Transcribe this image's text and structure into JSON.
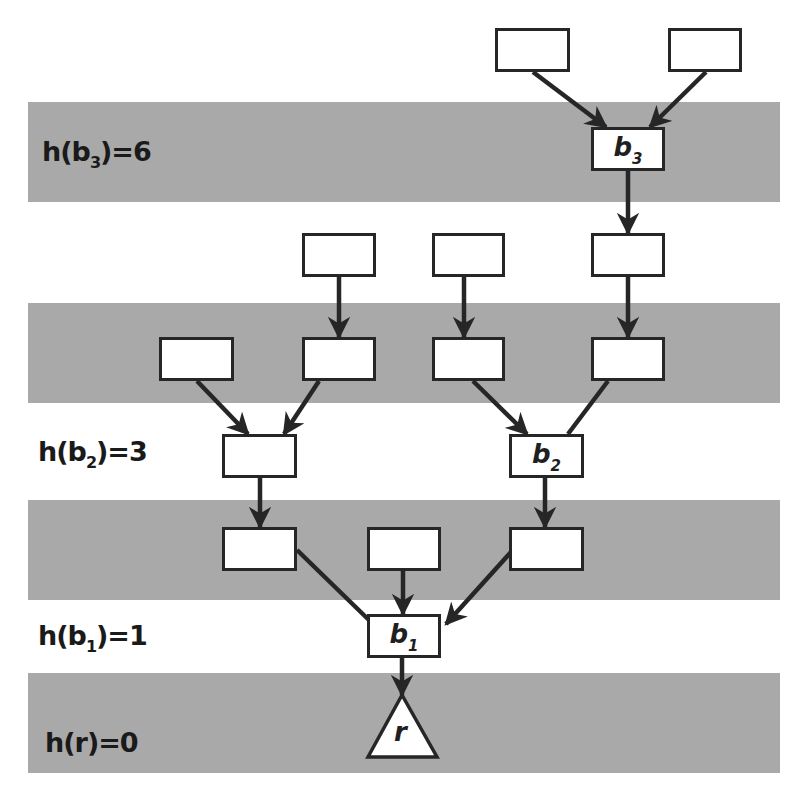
{
  "diagram": {
    "colors": {
      "band": "#a9a9a9",
      "background": "#ffffff",
      "stroke": "#262626",
      "node_fill": "#ffffff"
    },
    "bands": [
      {
        "id": "band-b3",
        "top": 102,
        "height": 100
      },
      {
        "id": "band-mid",
        "top": 303,
        "height": 100
      },
      {
        "id": "band-lower",
        "top": 500,
        "height": 100
      },
      {
        "id": "band-r",
        "top": 673,
        "height": 100
      }
    ],
    "levels": [
      {
        "id": "h-b3",
        "func": "h(b",
        "sub": "3",
        "rest": ")=6",
        "text": "h(b3)=6",
        "x": 42,
        "y": 136
      },
      {
        "id": "h-b2",
        "func": "h(b",
        "sub": "2",
        "rest": ")=3",
        "text": "h(b2)=3",
        "x": 38,
        "y": 436
      },
      {
        "id": "h-b1",
        "func": "h(b",
        "sub": "1",
        "rest": ")=1",
        "text": "h(b1)=1",
        "x": 38,
        "y": 620
      },
      {
        "id": "h-r",
        "func": "h(r)=0",
        "sub": "",
        "rest": "",
        "text": "h(r)=0",
        "x": 45,
        "y": 727
      }
    ],
    "nodes": [
      {
        "id": "n-top-left",
        "x": 495,
        "y": 28,
        "w": 75,
        "h": 44,
        "label": "",
        "sub": ""
      },
      {
        "id": "n-top-right",
        "x": 668,
        "y": 28,
        "w": 74,
        "h": 44,
        "label": "",
        "sub": ""
      },
      {
        "id": "n-b3",
        "x": 591,
        "y": 127,
        "w": 74,
        "h": 44,
        "label": "b",
        "sub": "3"
      },
      {
        "id": "n-r2-a",
        "x": 302,
        "y": 233,
        "w": 74,
        "h": 44,
        "label": "",
        "sub": ""
      },
      {
        "id": "n-r2-b",
        "x": 432,
        "y": 233,
        "w": 73,
        "h": 44,
        "label": "",
        "sub": ""
      },
      {
        "id": "n-r2-c",
        "x": 591,
        "y": 233,
        "w": 74,
        "h": 44,
        "label": "",
        "sub": ""
      },
      {
        "id": "n-r3-a",
        "x": 159,
        "y": 337,
        "w": 75,
        "h": 44,
        "label": "",
        "sub": ""
      },
      {
        "id": "n-r3-b",
        "x": 302,
        "y": 337,
        "w": 74,
        "h": 44,
        "label": "",
        "sub": ""
      },
      {
        "id": "n-r3-c",
        "x": 432,
        "y": 337,
        "w": 73,
        "h": 44,
        "label": "",
        "sub": ""
      },
      {
        "id": "n-r3-d",
        "x": 591,
        "y": 337,
        "w": 74,
        "h": 44,
        "label": "",
        "sub": ""
      },
      {
        "id": "n-r4-a",
        "x": 222,
        "y": 434,
        "w": 75,
        "h": 44,
        "label": "",
        "sub": ""
      },
      {
        "id": "n-b2",
        "x": 509,
        "y": 434,
        "w": 75,
        "h": 44,
        "label": "b",
        "sub": "2"
      },
      {
        "id": "n-r5-a",
        "x": 222,
        "y": 527,
        "w": 75,
        "h": 44,
        "label": "",
        "sub": ""
      },
      {
        "id": "n-r5-b",
        "x": 367,
        "y": 527,
        "w": 74,
        "h": 44,
        "label": "",
        "sub": ""
      },
      {
        "id": "n-r5-c",
        "x": 509,
        "y": 527,
        "w": 75,
        "h": 44,
        "label": "",
        "sub": ""
      },
      {
        "id": "n-b1",
        "x": 367,
        "y": 614,
        "w": 74,
        "h": 44,
        "label": "b",
        "sub": "1"
      }
    ],
    "root": {
      "id": "root-r",
      "label": "r",
      "apex": [
        402,
        695
      ],
      "base_left": [
        368,
        757
      ],
      "base_right": [
        437,
        757
      ]
    },
    "edges": [
      {
        "from": "n-top-left",
        "to": "n-b3",
        "x1": 533,
        "y1": 72,
        "x2": 606,
        "y2": 127
      },
      {
        "from": "n-top-right",
        "to": "n-b3",
        "x1": 706,
        "y1": 72,
        "x2": 650,
        "y2": 127
      },
      {
        "from": "n-b3",
        "to": "n-r2-c",
        "x1": 628,
        "y1": 171,
        "x2": 628,
        "y2": 233
      },
      {
        "from": "n-r2-a",
        "to": "n-r3-b",
        "x1": 339,
        "y1": 277,
        "x2": 339,
        "y2": 337
      },
      {
        "from": "n-r2-b",
        "to": "n-r3-c",
        "x1": 464,
        "y1": 277,
        "x2": 464,
        "y2": 337
      },
      {
        "from": "n-r2-c",
        "to": "n-r3-d",
        "x1": 628,
        "y1": 277,
        "x2": 628,
        "y2": 337
      },
      {
        "from": "n-r3-a",
        "to": "n-r4-a",
        "x1": 197,
        "y1": 381,
        "x2": 248,
        "y2": 434
      },
      {
        "from": "n-r3-b",
        "to": "n-r4-a",
        "x1": 319,
        "y1": 381,
        "x2": 284,
        "y2": 434
      },
      {
        "from": "n-r3-c",
        "to": "n-b2",
        "x1": 473,
        "y1": 381,
        "x2": 527,
        "y2": 434
      },
      {
        "from": "n-r3-d",
        "to": "n-b2",
        "x1": 608,
        "y1": 381,
        "x2": 568,
        "y2": 434,
        "no_arrow": true
      },
      {
        "from": "n-r4-a",
        "to": "n-r5-a",
        "x1": 260,
        "y1": 478,
        "x2": 260,
        "y2": 527
      },
      {
        "from": "n-b2",
        "to": "n-r5-c",
        "x1": 545,
        "y1": 478,
        "x2": 545,
        "y2": 527
      },
      {
        "from": "n-r5-a",
        "to": "n-b1",
        "x1": 297,
        "y1": 550,
        "x2": 371,
        "y2": 622,
        "no_arrow": true
      },
      {
        "from": "n-r5-b",
        "to": "n-b1",
        "x1": 403,
        "y1": 571,
        "x2": 403,
        "y2": 614
      },
      {
        "from": "n-r5-c",
        "to": "n-b1",
        "x1": 511,
        "y1": 552,
        "x2": 446,
        "y2": 624
      },
      {
        "from": "n-b1",
        "to": "root-r",
        "x1": 402,
        "y1": 658,
        "x2": 402,
        "y2": 695
      }
    ]
  }
}
